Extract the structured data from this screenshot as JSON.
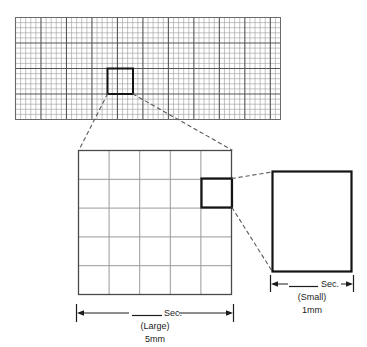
{
  "figure": {
    "type": "diagram",
    "background_color": "#ffffff",
    "ink_color": "#1c1c1c",
    "grid_line_color": "#9a9a9a",
    "grid_heavy_color": "#555555",
    "callout_style": "dashed"
  },
  "panels": {
    "strip": {
      "name": "ecg-paper-strip",
      "columns": 52,
      "rows": 20,
      "heavy_every": 5,
      "highlight_cell": {
        "col": 20,
        "row": 10,
        "span": 5
      }
    },
    "large": {
      "name": "large-square-magnified",
      "columns": 5,
      "rows": 5,
      "highlight_cell": {
        "col": 5,
        "row": 2
      }
    },
    "small": {
      "name": "small-square-magnified",
      "columns": 1,
      "rows": 1
    }
  },
  "labels": {
    "large": {
      "measure": "Sec.",
      "qualifier": "(Large)",
      "size": "5mm"
    },
    "small": {
      "measure": "Sec.",
      "qualifier": "(Small)",
      "size": "1mm"
    }
  }
}
